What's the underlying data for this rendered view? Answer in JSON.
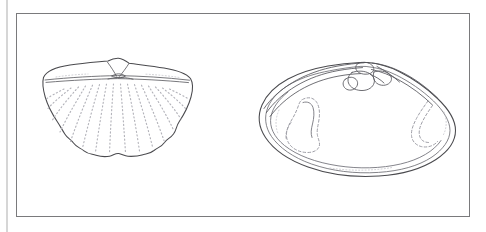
{
  "plate": {
    "title": "Bivalve shell illustration plate",
    "background_color": "#ffffff",
    "frame_color": "#7a7a7c",
    "ink_color": "#4a4a4e",
    "dotted_color": "#b3b3ba",
    "page_edge_color": "#d6d6d6",
    "frame": {
      "x": 16,
      "y": 13,
      "width": 454,
      "height": 204
    },
    "caption": "",
    "label_left": "",
    "label_right": ""
  },
  "figures": [
    {
      "id": "left-shell",
      "name": "ribbed-scallop-shell-exterior",
      "view": "exterior",
      "description": "Fan-shaped bivalve valve with straight hinge line, low central umbo, radiating dotted ribs and a scalloped ventral margin",
      "bounds": {
        "x": 42,
        "y": 58,
        "width": 151,
        "height": 100
      },
      "rib_count": 15,
      "margin_type": "crenulate",
      "umbo_position": "central",
      "hinge_type": "straight"
    },
    {
      "id": "right-shell",
      "name": "venerid-shell-interior",
      "view": "interior",
      "description": "Ovate-triangular bivalve valve interior showing hinge plate with cardinal teeth, anterior and posterior adductor muscle scars and pallial line",
      "bounds": {
        "x": 258,
        "y": 61,
        "width": 198,
        "height": 115
      },
      "features": [
        "hinge-plate",
        "cardinal-teeth",
        "anterior-adductor-scar",
        "posterior-adductor-scar",
        "pallial-line"
      ],
      "umbo_position": "posterior-central",
      "margin_type": "smooth"
    }
  ]
}
